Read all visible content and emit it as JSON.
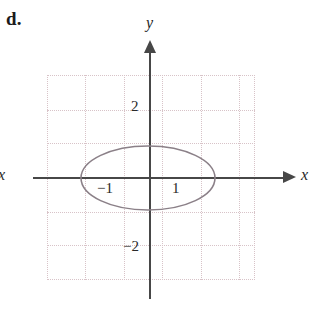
{
  "figure": {
    "part_label": "d.",
    "axis_labels": {
      "y": "y",
      "x": "x",
      "x_left_cut": "x"
    },
    "tick_labels": {
      "y_positive": "2",
      "y_negative": "−2",
      "x_negative": "−1",
      "x_positive": "1"
    },
    "colors": {
      "axis": "#474747",
      "grid": "#d8c3c8",
      "curve": "#8b8088",
      "text": "#1f1f1f",
      "background": "#ffffff"
    }
  },
  "chart_data": {
    "type": "line",
    "title": "",
    "xlabel": "x",
    "ylabel": "y",
    "grid": true,
    "legend": "none",
    "xlim": [
      -3.8,
      3.8
    ],
    "ylim": [
      -3.1,
      3.1
    ],
    "xticks": [
      -1,
      1
    ],
    "xtick_labels": [
      "−1",
      "1"
    ],
    "yticks": [
      2,
      -2
    ],
    "ytick_labels": [
      "2",
      "−2"
    ],
    "curves": [
      {
        "name": "ellipse",
        "shape": "ellipse",
        "center": [
          0,
          0
        ],
        "semi_axis_x": 2.0,
        "semi_axis_y": 0.95,
        "equation": "x^2/4 + y^2/0.9 = 1",
        "closed": true,
        "x_intercepts": [
          -2.0,
          2.0
        ],
        "y_intercepts": [
          -0.95,
          0.95
        ],
        "color": "#8b8088"
      }
    ],
    "pixel_geometry": {
      "origin_px": [
        149,
        177
      ],
      "ellipse_center_px": [
        148,
        178
      ],
      "ellipse_rx_px": 67,
      "ellipse_ry_px": 32,
      "grid_box_px": [
        47,
        75,
        208,
        205
      ],
      "grid_step_x_px": 38.5,
      "grid_step_y_px": 34.2
    }
  }
}
